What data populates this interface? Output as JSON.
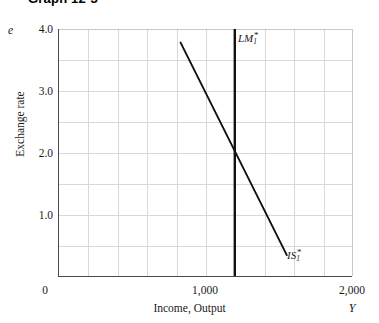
{
  "title": "Graph 12-3",
  "chart_data": {
    "type": "line",
    "title": "Graph 12-3",
    "xlabel": "Income, Output",
    "ylabel": "Exchange rate",
    "x_var_symbol": "Y",
    "y_var_symbol": "e",
    "xlim": [
      0,
      2000
    ],
    "ylim": [
      0,
      4.0
    ],
    "xticks": [
      0,
      1000,
      2000
    ],
    "xtick_labels": [
      "0",
      "1,000",
      "2,000"
    ],
    "yticks": [
      1.0,
      2.0,
      3.0,
      4.0
    ],
    "ytick_labels": [
      "1.0",
      "2.0",
      "3.0",
      "4.0"
    ],
    "grid": true,
    "grid_x_divisions": 10,
    "grid_y_divisions": 8,
    "legend": "none",
    "series": [
      {
        "name": "LM_1*",
        "label_html": "LM<sub>1</sub><sup>*</sup>",
        "type": "vertical-line",
        "x": 1200,
        "y_start": 4.0,
        "y_end": 0.0,
        "color": "#111111",
        "linewidth": 2.4
      },
      {
        "name": "IS_1*",
        "label_html": "IS<sub>1</sub><sup>*</sup>",
        "type": "line",
        "points": [
          [
            830,
            3.78
          ],
          [
            1555,
            0.34
          ]
        ],
        "color": "#111111",
        "linewidth": 1.9
      }
    ],
    "annotations": [
      {
        "name": "equilibrium",
        "x": 1200,
        "y": 2.0,
        "note": "Intersection of IS_1* and LM_1*"
      }
    ]
  }
}
